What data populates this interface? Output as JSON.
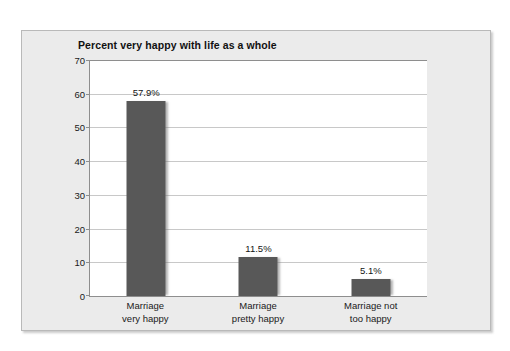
{
  "chart_data": {
    "type": "bar",
    "title": "Percent very happy with life as a whole",
    "xlabel": "",
    "ylabel": "",
    "categories": [
      "Marriage\nvery happy",
      "Marriage\npretty happy",
      "Marriage not\ntoo happy"
    ],
    "category_lines": [
      [
        "Marriage",
        "very happy"
      ],
      [
        "Marriage",
        "pretty happy"
      ],
      [
        "Marriage not",
        "too happy"
      ]
    ],
    "values": [
      57.9,
      11.5,
      5.1
    ],
    "value_labels": [
      "57.9%",
      "11.5%",
      "5.1%"
    ],
    "ylim": [
      0,
      70
    ],
    "yticks": [
      70,
      60,
      50,
      40,
      30,
      20,
      10,
      0
    ],
    "ytick_labels": [
      "70",
      "60",
      "50",
      "40",
      "30",
      "20",
      "10",
      "0"
    ],
    "grid": true,
    "legend": false,
    "bar_color": "#585858",
    "plot_background": "#ffffff",
    "panel_background": "#ebebeb",
    "gridline_color": "#c8c8c8",
    "axis_color": "#8e8e8e"
  }
}
